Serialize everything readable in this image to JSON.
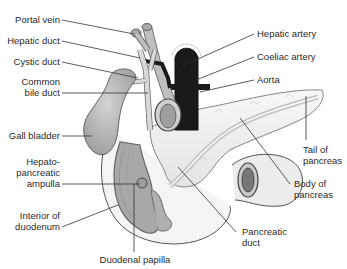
{
  "diagram": {
    "colors": {
      "background": "#ffffff",
      "line": "#333333",
      "text": "#2a2a2a",
      "vessel_dark": "#1a1a1a",
      "organ_gray": "#bdbdbd",
      "duct_light": "#d9d9d9",
      "pancreas_fill": "#f2f2f2",
      "duodenum_interior": "#a8a8a8"
    },
    "labels": {
      "portal_vein": "Portal vein",
      "hepatic_duct": "Hepatic duct",
      "cystic_duct": "Cystic duct",
      "common_bile_duct_1": "Common",
      "common_bile_duct_2": "bile duct",
      "gall_bladder": "Gall bladder",
      "hepatopancreatic_ampulla_1": "Hepato-",
      "hepatopancreatic_ampulla_2": "pancreatic",
      "hepatopancreatic_ampulla_3": "ampulla",
      "interior_of_duodenum_1": "Interior of",
      "interior_of_duodenum_2": "duodenum",
      "duodenal_papilla": "Duodenal papilla",
      "pancreatic_duct_1": "Pancreatic",
      "pancreatic_duct_2": "duct",
      "body_of_pancreas_1": "Body of",
      "body_of_pancreas_2": "pancreas",
      "tail_of_pancreas_1": "Tail of",
      "tail_of_pancreas_2": "pancreas",
      "hepatic_artery": "Hepatic artery",
      "coeliac_artery": "Coeliac artery",
      "aorta": "Aorta"
    }
  }
}
